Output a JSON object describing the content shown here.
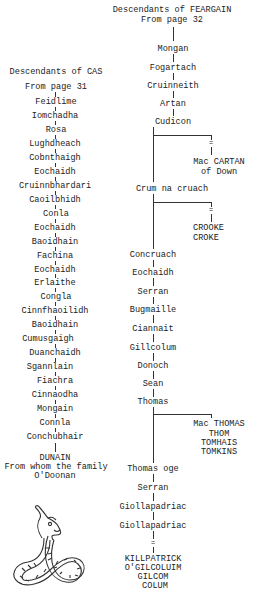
{
  "right_tree": {
    "title": "Descendants of FEARGAIN",
    "subtitle": "From page 32",
    "lineage": [
      "Mongan",
      "Fogartach",
      "Cruinneith",
      "Artan",
      "Cudicon",
      "Crum na cruach",
      "Concruach",
      "Eochaidh",
      "Serran",
      "Bugmaille",
      "Ciannait",
      "Gillcolum",
      "Donoch",
      "Sean",
      "Thomas",
      "Thomas oge",
      "Serran",
      "Giollapadriac",
      "Giollapadriac"
    ],
    "branches": [
      {
        "from": "Cudicon",
        "symbol": "=",
        "names": [
          "Mac CARTAN",
          "of Down"
        ]
      },
      {
        "from": "Crum na cruach",
        "symbol": "=",
        "names": [
          "CROOKE",
          "CROKE"
        ]
      },
      {
        "from": "Thomas",
        "symbol": "",
        "names": [
          "Mac THOMAS",
          "THOM",
          "TOMHAIS",
          "TOMKINS"
        ]
      }
    ],
    "end_symbol": "=",
    "end_names": [
      "KILLPATRICK",
      "O'GILCOLUIM",
      "GILCOM",
      "COLUM"
    ]
  },
  "left_tree": {
    "title": "Descendants of CAS",
    "subtitle": "From page 31",
    "lineage": [
      "Feidlime",
      "Iomchadha",
      "Rosa",
      "Lughdheach",
      "Cobnthaigh",
      "Eochaidh",
      "Cruinnbhardari",
      "Caoilbhidh",
      "Conla",
      "Eochaidh",
      "Baoidhain",
      "Fachina",
      "Eochaidh",
      "Erlaithe",
      "Congla",
      "Cinnfhaoilidh",
      "Baoidhain",
      "Cumusgaigh",
      "Duanchaidh",
      "Sgannlain",
      "Fiachra",
      "Cinnaodha",
      "Mongain",
      "Connla",
      "Conchubhair"
    ],
    "end_name": "DUNAIN",
    "end_note": [
      "From whom the family",
      "O'Doonan"
    ]
  },
  "illustration": "celtic-serpent"
}
